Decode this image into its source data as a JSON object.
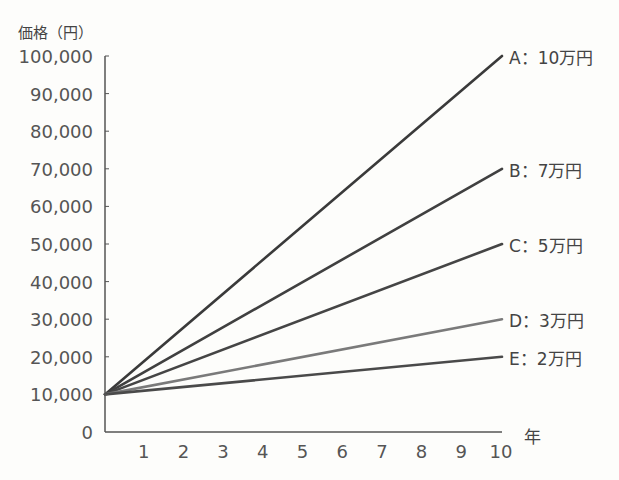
{
  "chart_data": {
    "type": "line",
    "title": "",
    "ylabel": "価格（円）",
    "xlabel": "年",
    "x": [
      0,
      10
    ],
    "xticks": [
      "1",
      "2",
      "3",
      "4",
      "5",
      "6",
      "7",
      "8",
      "9",
      "10"
    ],
    "yticks": [
      "0",
      "10,000",
      "20,000",
      "30,000",
      "40,000",
      "50,000",
      "60,000",
      "70,000",
      "80,000",
      "90,000",
      "100,000"
    ],
    "xlim": [
      0,
      10
    ],
    "ylim": [
      0,
      100000
    ],
    "grid": false,
    "legend": "inline labels at right end of each line",
    "series": [
      {
        "name": "A：10万円",
        "values": [
          10000,
          100000
        ],
        "color": "#3a3a3a"
      },
      {
        "name": "B：7万円",
        "values": [
          10000,
          70000
        ],
        "color": "#404040"
      },
      {
        "name": "C：5万円",
        "values": [
          10000,
          50000
        ],
        "color": "#454545"
      },
      {
        "name": "D：3万円",
        "values": [
          10000,
          30000
        ],
        "color": "#7a7a7a"
      },
      {
        "name": "E：2万円",
        "values": [
          10000,
          20000
        ],
        "color": "#4a4a4a"
      }
    ]
  }
}
